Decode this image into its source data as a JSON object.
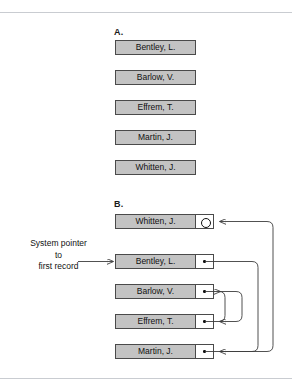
{
  "figure": {
    "width": 292,
    "height": 388,
    "background": "#ffffff",
    "rule_color": "#c9ccd1"
  },
  "colors": {
    "record_fill": "#c3c3c3",
    "record_border": "#4a4a4a",
    "pointer_fill": "#ffffff",
    "link_stroke": "#3d3d3d",
    "text": "#111111"
  },
  "sections": {
    "a": {
      "label": "A.",
      "records": [
        {
          "name": "Bentley, L."
        },
        {
          "name": "Barlow, V."
        },
        {
          "name": "Effrem, T."
        },
        {
          "name": "Martin, J."
        },
        {
          "name": "Whitten, J."
        }
      ]
    },
    "b": {
      "label": "B.",
      "records": [
        {
          "name": "Whitten, J.",
          "pointer": "null"
        },
        {
          "name": "Bentley, L.",
          "pointer": "link"
        },
        {
          "name": "Barlow, V.",
          "pointer": "link"
        },
        {
          "name": "Effrem, T.",
          "pointer": "link"
        },
        {
          "name": "Martin, J.",
          "pointer": "link"
        }
      ],
      "system_pointer_caption": {
        "line1": "System pointer",
        "line2": "to",
        "line3": "first record"
      }
    }
  }
}
